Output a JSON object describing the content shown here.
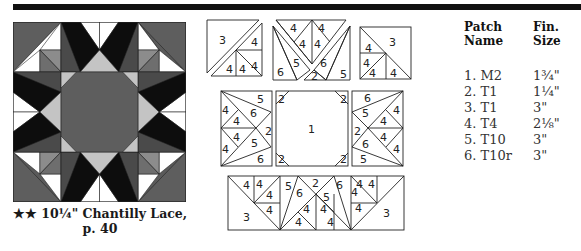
{
  "caption": {
    "line1": "★★ 10¼\" Chantilly Lace,",
    "line2": "p. 40"
  },
  "table": {
    "headers": {
      "col1_line1": "Patch",
      "col1_line2": "Name",
      "col2_line1": "Fin.",
      "col2_line2": "Size"
    },
    "rows": [
      {
        "name": "1. M2",
        "size": "1¾\""
      },
      {
        "name": "2. T1",
        "size": "1¼\""
      },
      {
        "name": "3. T1",
        "size": "3\""
      },
      {
        "name": "4. T4",
        "size": "2⅛\""
      },
      {
        "name": "5. T10",
        "size": "3\""
      },
      {
        "name": "6. T10r",
        "size": "3\""
      }
    ]
  },
  "diagram": {
    "labels": {
      "p1": "1",
      "p2": "2",
      "p3": "3",
      "p4": "4",
      "p5": "5",
      "p6": "6"
    }
  },
  "colors": {
    "dark": "#0d0d0d",
    "medium_dark": "#4a4a4a",
    "medium": "#6e6e6e",
    "light_gray": "#a9a9a9",
    "pale_gray": "#c4c4c4",
    "white": "#ffffff"
  }
}
